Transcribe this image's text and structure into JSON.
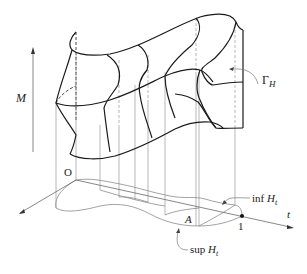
{
  "figure": {
    "labels": {
      "vertical_axis": "M",
      "origin": "O",
      "horizontal_axis": "t",
      "surface": "Γ",
      "surface_sub": "H",
      "region": "A",
      "unit_tick": "1",
      "inf_prefix": "inf ",
      "inf_var": "H",
      "inf_sub": "t",
      "sup_prefix": "sup ",
      "sup_var": "H",
      "sup_sub": "t"
    },
    "colors": {
      "surface_stroke": "#1a1a1a",
      "projection_stroke": "#9a9a9a",
      "axis_stroke": "#6a6a6a",
      "background": "#ffffff"
    }
  }
}
